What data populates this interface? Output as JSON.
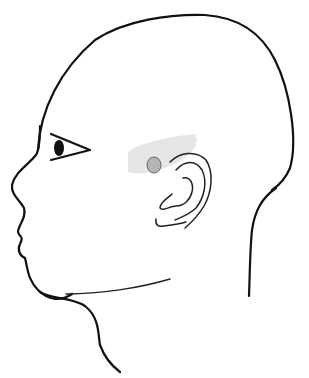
{
  "figure": {
    "colors": {
      "background": "#ffffff",
      "outline": "#111111",
      "highlight_region": "#e6e6e6",
      "marker_fill": "#b5b5b5",
      "marker_stroke": "#666666"
    },
    "highlight_region": {
      "label": "Shaded area in front of and above the ear"
    },
    "marker": {
      "label": "Gray dot (point location) in front of the ear"
    }
  }
}
